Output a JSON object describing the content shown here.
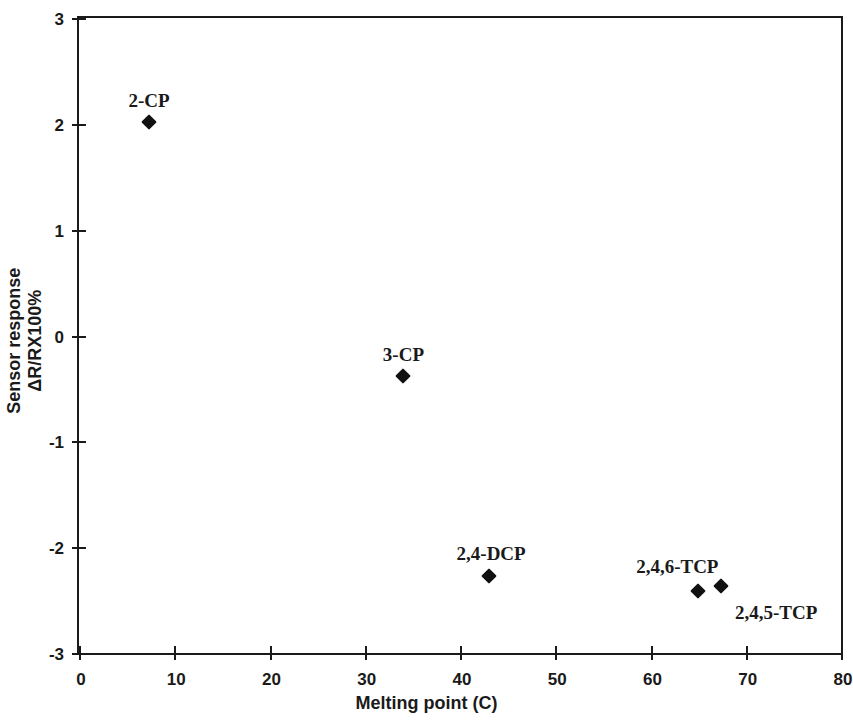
{
  "chart_data": {
    "type": "scatter",
    "title": "",
    "xlabel": "Melting point (C)",
    "ylabel_line1": "Sensor response",
    "ylabel_line2": "ΔR/RX100%",
    "xlim": [
      0,
      80
    ],
    "ylim": [
      -3,
      3
    ],
    "xticks": [
      0,
      10,
      20,
      30,
      40,
      50,
      60,
      70,
      80
    ],
    "yticks": [
      3,
      2,
      1,
      0,
      -1,
      -2,
      -3
    ],
    "xtick_labels": [
      "0",
      "10",
      "20",
      "30",
      "40",
      "50",
      "60",
      "70",
      "80"
    ],
    "ytick_labels": [
      "3",
      "2",
      "1",
      "0",
      "-1",
      "-2",
      "-3"
    ],
    "grid": false,
    "legend": "none",
    "marker": "filled-diamond",
    "marker_color": "#111111",
    "points": [
      {
        "label": "2-CP",
        "x": 7.4,
        "y": 2.02,
        "label_dx": -21,
        "label_dy": -32
      },
      {
        "label": "3-CP",
        "x": 34.0,
        "y": -0.38,
        "label_dx": -20,
        "label_dy": -32
      },
      {
        "label": "2,4-DCP",
        "x": 43.0,
        "y": -2.27,
        "label_dx": -32,
        "label_dy": -33
      },
      {
        "label": "2,4,6-TCP",
        "x": 65.0,
        "y": -2.41,
        "label_dx": -62,
        "label_dy": -35
      },
      {
        "label": "2,4,5-TCP",
        "x": 67.4,
        "y": -2.37,
        "label_dx": 14,
        "label_dy": 16
      }
    ]
  }
}
